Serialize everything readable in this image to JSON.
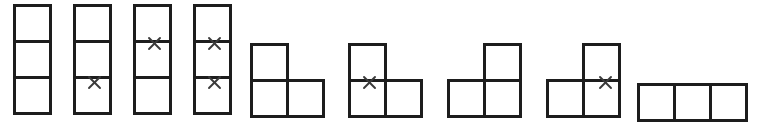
{
  "figure": {
    "background_color": "#ffffff",
    "line_color": "#1d1d1d",
    "mark_color": "#3a3a3a",
    "cell_size_px": 39,
    "line_width_px": 3,
    "mark_glyph": "x-cross",
    "canvas": {
      "width_px": 757,
      "height_px": 134
    }
  },
  "shapes": [
    {
      "index": 1,
      "name": "vertical-i-tromino-unmarked",
      "orientation": "vertical",
      "cell_count": 3,
      "origin_px": {
        "x": 13,
        "y": 4
      },
      "cells": [
        {
          "col": 0,
          "row": 0
        },
        {
          "col": 0,
          "row": 1
        },
        {
          "col": 0,
          "row": 2
        }
      ],
      "marks": []
    },
    {
      "index": 2,
      "name": "vertical-i-tromino-lower-edge-marked",
      "orientation": "vertical",
      "cell_count": 3,
      "origin_px": {
        "x": 73,
        "y": 4
      },
      "cells": [
        {
          "col": 0,
          "row": 0
        },
        {
          "col": 0,
          "row": 1
        },
        {
          "col": 0,
          "row": 2
        }
      ],
      "marks": [
        {
          "edge": "horizontal-lower",
          "offset_px": {
            "x": 21,
            "y": 78
          }
        }
      ]
    },
    {
      "index": 3,
      "name": "vertical-i-tromino-upper-edge-marked",
      "orientation": "vertical",
      "cell_count": 3,
      "origin_px": {
        "x": 133,
        "y": 4
      },
      "cells": [
        {
          "col": 0,
          "row": 0
        },
        {
          "col": 0,
          "row": 1
        },
        {
          "col": 0,
          "row": 2
        }
      ],
      "marks": [
        {
          "edge": "horizontal-upper",
          "offset_px": {
            "x": 21,
            "y": 39
          }
        }
      ]
    },
    {
      "index": 4,
      "name": "vertical-i-tromino-both-edges-marked",
      "orientation": "vertical",
      "cell_count": 3,
      "origin_px": {
        "x": 193,
        "y": 4
      },
      "cells": [
        {
          "col": 0,
          "row": 0
        },
        {
          "col": 0,
          "row": 1
        },
        {
          "col": 0,
          "row": 2
        }
      ],
      "marks": [
        {
          "edge": "horizontal-upper",
          "offset_px": {
            "x": 21,
            "y": 39
          }
        },
        {
          "edge": "horizontal-lower",
          "offset_px": {
            "x": 21,
            "y": 78
          }
        }
      ]
    },
    {
      "index": 5,
      "name": "l-tromino-unmarked",
      "orientation": "corner-top-left",
      "cell_count": 3,
      "origin_px": {
        "x": 250,
        "y": 43
      },
      "cells": [
        {
          "col": 0,
          "row": 0
        },
        {
          "col": 0,
          "row": 1
        },
        {
          "col": 1,
          "row": 1
        }
      ],
      "marks": []
    },
    {
      "index": 6,
      "name": "l-tromino-vertical-edge-marked",
      "orientation": "corner-top-left",
      "cell_count": 3,
      "origin_px": {
        "x": 348,
        "y": 43
      },
      "cells": [
        {
          "col": 0,
          "row": 0
        },
        {
          "col": 0,
          "row": 1
        },
        {
          "col": 1,
          "row": 1
        }
      ],
      "marks": [
        {
          "edge": "horizontal-left-column",
          "offset_px": {
            "x": 21,
            "y": 39
          }
        }
      ]
    },
    {
      "index": 7,
      "name": "j-tromino-unmarked",
      "orientation": "corner-top-right",
      "cell_count": 3,
      "origin_px": {
        "x": 447,
        "y": 43
      },
      "cells": [
        {
          "col": 1,
          "row": 0
        },
        {
          "col": 0,
          "row": 1
        },
        {
          "col": 1,
          "row": 1
        }
      ],
      "marks": []
    },
    {
      "index": 8,
      "name": "j-tromino-vertical-edge-marked",
      "orientation": "corner-top-right",
      "cell_count": 3,
      "origin_px": {
        "x": 546,
        "y": 43
      },
      "cells": [
        {
          "col": 1,
          "row": 0
        },
        {
          "col": 0,
          "row": 1
        },
        {
          "col": 1,
          "row": 1
        }
      ],
      "marks": [
        {
          "edge": "horizontal-right-column",
          "offset_px": {
            "x": 59,
            "y": 39
          }
        }
      ]
    },
    {
      "index": 9,
      "name": "horizontal-i-tromino-unmarked",
      "orientation": "horizontal",
      "cell_count": 3,
      "origin_px": {
        "x": 637,
        "y": 83
      },
      "cells": [
        {
          "col": 0,
          "row": 0
        },
        {
          "col": 1,
          "row": 0
        },
        {
          "col": 2,
          "row": 0
        }
      ],
      "marks": []
    }
  ]
}
